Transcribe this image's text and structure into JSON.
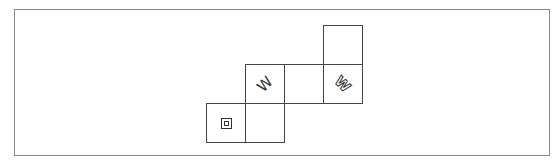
{
  "diagram": {
    "type": "cube-net",
    "cell_size_px": 39,
    "faces": [
      {
        "id": "top",
        "row": 0,
        "col": 3,
        "symbol": "",
        "symbol_name": "blank"
      },
      {
        "id": "mid-1",
        "row": 1,
        "col": 1,
        "symbol": "W",
        "symbol_name": "letter-w-rotated",
        "rotation_deg": -45
      },
      {
        "id": "mid-2",
        "row": 1,
        "col": 2,
        "symbol": "",
        "symbol_name": "blank"
      },
      {
        "id": "mid-3",
        "row": 1,
        "col": 3,
        "symbol": "W",
        "symbol_name": "outlined-w-rotated",
        "rotation_deg": 45
      },
      {
        "id": "bottom-1",
        "row": 2,
        "col": 0,
        "symbol": "",
        "symbol_name": "nested-square"
      },
      {
        "id": "bottom-2",
        "row": 2,
        "col": 1,
        "symbol": "",
        "symbol_name": "blank"
      }
    ],
    "colors": {
      "line": "#444444",
      "frame": "#8a8a8a",
      "background": "#ffffff"
    }
  }
}
